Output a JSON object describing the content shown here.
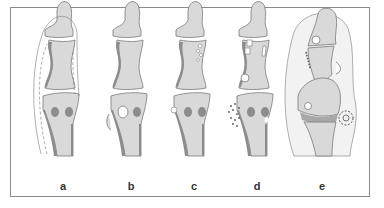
{
  "figure": {
    "panels": [
      {
        "id": "a",
        "label": "a",
        "x": 63
      },
      {
        "id": "b",
        "label": "b",
        "x": 131
      },
      {
        "id": "c",
        "label": "c",
        "x": 194
      },
      {
        "id": "d",
        "label": "d",
        "x": 257
      },
      {
        "id": "e",
        "label": "e",
        "x": 322
      }
    ],
    "colors": {
      "bone_fill": "#d9d9d9",
      "bone_shadow": "#8c8c8c",
      "outline": "#7a7a7a",
      "soft_tissue": "#eeeeee",
      "frame_border": "#8a8a8a",
      "background": "#ffffff"
    }
  }
}
